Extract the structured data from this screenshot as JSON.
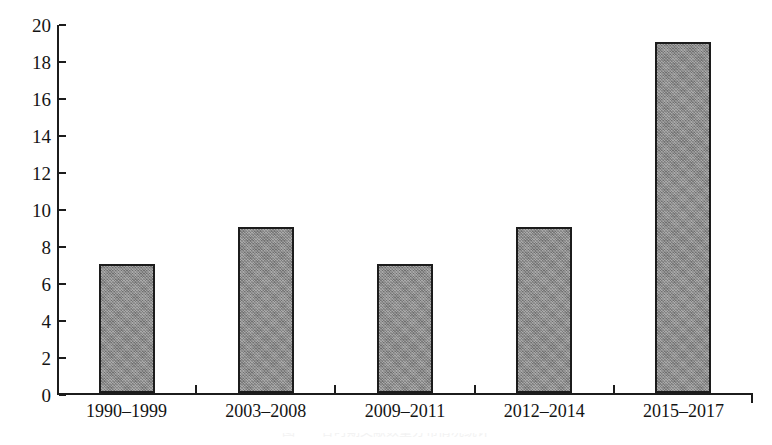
{
  "chart_data": {
    "type": "bar",
    "title": "",
    "subtitle": "",
    "xlabel": "",
    "ylabel": "",
    "categories": [
      "1990–1999",
      "2003–2008",
      "2009–2011",
      "2012–2014",
      "2015–2017"
    ],
    "values": [
      7,
      9,
      7,
      9,
      19
    ],
    "ylim": [
      0,
      20
    ],
    "ytick_labels": [
      "0",
      "2",
      "4",
      "6",
      "8",
      "10",
      "12",
      "14",
      "16",
      "18",
      "20"
    ],
    "ytick_values": [
      0,
      2,
      4,
      6,
      8,
      10,
      12,
      14,
      16,
      18,
      20
    ],
    "grid": false,
    "legend": null,
    "series": [
      {
        "name": "",
        "values": [
          7,
          9,
          7,
          9,
          19
        ]
      }
    ],
    "colors": {
      "bar_fill": "#8e8e8e",
      "bar_border": "#1c1c1c",
      "axis": "#1c1c1c",
      "text": "#141414",
      "background": "#ffffff"
    }
  },
  "caption": {
    "text": "图一　各时期文献数量分布情况统计"
  }
}
